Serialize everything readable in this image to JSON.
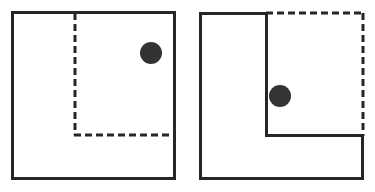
{
  "figure": {
    "canvas": {
      "width": 375,
      "height": 192,
      "background": "#ffffff"
    },
    "style": {
      "line_color": "#262626",
      "dash_color": "#262626",
      "dot_color": "#333333",
      "solid_width": 3,
      "dash_width": 3,
      "dash_pattern": "7 4"
    },
    "panels": [
      {
        "id": "left-panel",
        "name": "square-with-dashed-inner-corner",
        "shape_type": "square",
        "solid_path": "M 12.5 12.5 L 174.5 12.5 L 174.5 178.5 L 12.5 178.5 Z",
        "dashed_paths": [
          "M 75 13 L 75 135",
          "M 74 135 L 175 135"
        ],
        "dot": {
          "cx": 151,
          "cy": 53,
          "r": 11
        }
      },
      {
        "id": "right-panel",
        "name": "l-shape-with-dashed-completion",
        "shape_type": "l-polygon",
        "solid_path": "M 200.5 13.5 L 266.5 13.5 L 266.5 135.5 L 362.5 135.5 L 362.5 178.5 L 200.5 178.5 Z",
        "dashed_paths": [
          "M 266 13 L 364 13",
          "M 363 13 L 363 136"
        ],
        "dot": {
          "cx": 280,
          "cy": 96,
          "r": 11
        }
      }
    ]
  }
}
